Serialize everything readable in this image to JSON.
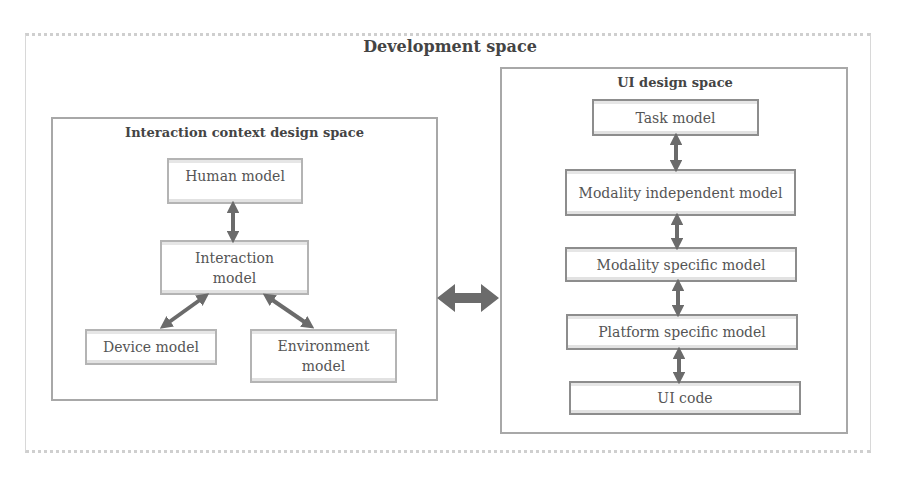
{
  "development_space": {
    "title": "Development space"
  },
  "interaction_context_space": {
    "title": "Interaction context design space",
    "nodes": [
      {
        "id": "human",
        "label": "Human model"
      },
      {
        "id": "interaction",
        "label": "Interaction model"
      },
      {
        "id": "device",
        "label": "Device model"
      },
      {
        "id": "environment",
        "label": "Environment model"
      }
    ],
    "edges": [
      {
        "from": "human",
        "to": "interaction",
        "type": "bidirectional"
      },
      {
        "from": "interaction",
        "to": "device",
        "type": "bidirectional"
      },
      {
        "from": "interaction",
        "to": "environment",
        "type": "bidirectional"
      }
    ]
  },
  "ui_design_space": {
    "title": "UI design space",
    "nodes": [
      {
        "id": "task",
        "label": "Task model"
      },
      {
        "id": "modality_independent",
        "label": "Modality independent model"
      },
      {
        "id": "modality_specific",
        "label": "Modality specific model"
      },
      {
        "id": "platform_specific",
        "label": "Platform specific model"
      },
      {
        "id": "ui_code",
        "label": "UI code"
      }
    ],
    "edges": [
      {
        "from": "task",
        "to": "modality_independent",
        "type": "bidirectional"
      },
      {
        "from": "modality_independent",
        "to": "modality_specific",
        "type": "bidirectional"
      },
      {
        "from": "modality_specific",
        "to": "platform_specific",
        "type": "bidirectional"
      },
      {
        "from": "platform_specific",
        "to": "ui_code",
        "type": "bidirectional"
      }
    ]
  },
  "cross_link": {
    "from": "interaction_context_space",
    "to": "ui_design_space",
    "type": "bidirectional"
  },
  "colors": {
    "arrow": "#6b6b6b",
    "box_border": "#a8a8a8",
    "text": "#555555"
  }
}
